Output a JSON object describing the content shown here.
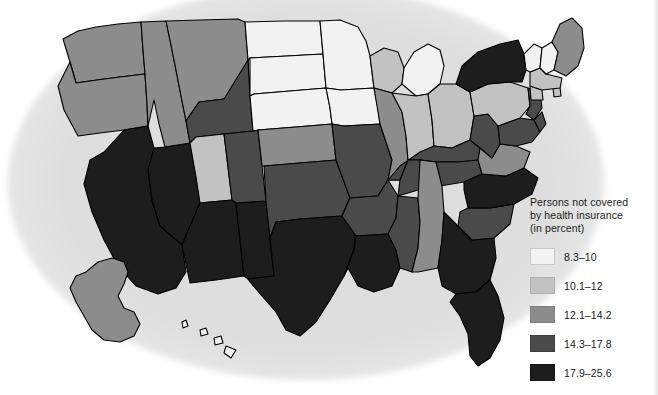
{
  "figure": {
    "kind": "choropleth-map",
    "region": "United States"
  },
  "legend": {
    "title": "Persons not covered\nby health insurance\n(in percent)",
    "title_lines": [
      "Persons not covered",
      "by health insurance",
      "(in percent)"
    ],
    "classes": [
      {
        "label": "8.3–10",
        "color": "#f2f2f2",
        "stroke": "#c9c9c9",
        "min": 8.3,
        "max": 10.0
      },
      {
        "label": "10.1–12",
        "color": "#c2c2c2",
        "stroke": "#b0b0b0",
        "min": 10.1,
        "max": 12.0
      },
      {
        "label": "12.1–14.2",
        "color": "#8c8c8c",
        "stroke": "#7e7e7e",
        "min": 12.1,
        "max": 14.2
      },
      {
        "label": "14.3–17.8",
        "color": "#4a4a4a",
        "stroke": "#3f3f3f",
        "min": 14.3,
        "max": 17.8
      },
      {
        "label": "17.9–25.6",
        "color": "#1d1d1d",
        "stroke": "#141414",
        "min": 17.9,
        "max": 25.6
      }
    ]
  },
  "chart_data": {
    "type": "map",
    "title": "Persons not covered by health insurance (in percent)",
    "value_unit": "percent",
    "classification": "5-class graduated gray scale, low = light, high = dark",
    "class_breaks": [
      "8.3–10",
      "10.1–12",
      "12.1–14.2",
      "14.3–17.8",
      "17.9–25.6"
    ],
    "states": [
      {
        "code": "WA",
        "name": "Washington",
        "class": 2
      },
      {
        "code": "OR",
        "name": "Oregon",
        "class": 2
      },
      {
        "code": "CA",
        "name": "California",
        "class": 4
      },
      {
        "code": "NV",
        "name": "Nevada",
        "class": 4
      },
      {
        "code": "ID",
        "name": "Idaho",
        "class": 2
      },
      {
        "code": "MT",
        "name": "Montana",
        "class": 2
      },
      {
        "code": "WY",
        "name": "Wyoming",
        "class": 3
      },
      {
        "code": "UT",
        "name": "Utah",
        "class": 1
      },
      {
        "code": "AZ",
        "name": "Arizona",
        "class": 4
      },
      {
        "code": "NM",
        "name": "New Mexico",
        "class": 4
      },
      {
        "code": "CO",
        "name": "Colorado",
        "class": 3
      },
      {
        "code": "ND",
        "name": "North Dakota",
        "class": 0
      },
      {
        "code": "SD",
        "name": "South Dakota",
        "class": 0
      },
      {
        "code": "NE",
        "name": "Nebraska",
        "class": 0
      },
      {
        "code": "KS",
        "name": "Kansas",
        "class": 2
      },
      {
        "code": "OK",
        "name": "Oklahoma",
        "class": 3
      },
      {
        "code": "TX",
        "name": "Texas",
        "class": 4
      },
      {
        "code": "MN",
        "name": "Minnesota",
        "class": 0
      },
      {
        "code": "IA",
        "name": "Iowa",
        "class": 0
      },
      {
        "code": "MO",
        "name": "Missouri",
        "class": 3
      },
      {
        "code": "AR",
        "name": "Arkansas",
        "class": 3
      },
      {
        "code": "LA",
        "name": "Louisiana",
        "class": 4
      },
      {
        "code": "WI",
        "name": "Wisconsin",
        "class": 1
      },
      {
        "code": "IL",
        "name": "Illinois",
        "class": 2
      },
      {
        "code": "MI",
        "name": "Michigan",
        "class": 0
      },
      {
        "code": "IN",
        "name": "Indiana",
        "class": 1
      },
      {
        "code": "OH",
        "name": "Ohio",
        "class": 1
      },
      {
        "code": "KY",
        "name": "Kentucky",
        "class": 3
      },
      {
        "code": "TN",
        "name": "Tennessee",
        "class": 3
      },
      {
        "code": "MS",
        "name": "Mississippi",
        "class": 3
      },
      {
        "code": "AL",
        "name": "Alabama",
        "class": 2
      },
      {
        "code": "GA",
        "name": "Georgia",
        "class": 4
      },
      {
        "code": "FL",
        "name": "Florida",
        "class": 4
      },
      {
        "code": "SC",
        "name": "South Carolina",
        "class": 3
      },
      {
        "code": "NC",
        "name": "North Carolina",
        "class": 4
      },
      {
        "code": "VA",
        "name": "Virginia",
        "class": 2
      },
      {
        "code": "WV",
        "name": "West Virginia",
        "class": 3
      },
      {
        "code": "MD",
        "name": "Maryland",
        "class": 3
      },
      {
        "code": "DE",
        "name": "Delaware",
        "class": 3
      },
      {
        "code": "PA",
        "name": "Pennsylvania",
        "class": 1
      },
      {
        "code": "NJ",
        "name": "New Jersey",
        "class": 3
      },
      {
        "code": "NY",
        "name": "New York",
        "class": 4
      },
      {
        "code": "CT",
        "name": "Connecticut",
        "class": 1
      },
      {
        "code": "RI",
        "name": "Rhode Island",
        "class": 1
      },
      {
        "code": "MA",
        "name": "Massachusetts",
        "class": 1
      },
      {
        "code": "VT",
        "name": "Vermont",
        "class": 0
      },
      {
        "code": "NH",
        "name": "New Hampshire",
        "class": 0
      },
      {
        "code": "ME",
        "name": "Maine",
        "class": 2
      },
      {
        "code": "AK",
        "name": "Alaska",
        "class": 2
      },
      {
        "code": "HI",
        "name": "Hawaii",
        "class": 0
      }
    ]
  }
}
